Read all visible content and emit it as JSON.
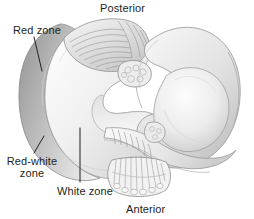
{
  "figure": {
    "orientation_labels": {
      "top": "Posterior",
      "bottom": "Anterior"
    },
    "zone_labels": {
      "red": "Red zone",
      "red_white_line1": "Red-white",
      "red_white_line2": "zone",
      "white": "White zone"
    },
    "colors": {
      "background": "#ffffff",
      "text": "#231f20",
      "leader_line": "#231f20",
      "outline": "#8d8d8d",
      "rim_shade": "#b6b6b6",
      "body_light": "#f4f4f4",
      "body_mid": "#e3e3e3",
      "body_dark": "#cfcfcf",
      "fiber": "#9a9a9a"
    }
  }
}
